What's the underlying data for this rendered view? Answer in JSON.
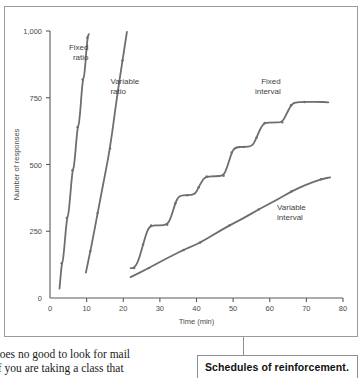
{
  "figure": {
    "caption": "Schedules of reinforcement."
  },
  "body_text": {
    "line1": "does no good to look for mail",
    "line2": "If you are taking a class that"
  },
  "chart_data": {
    "type": "line",
    "title": "",
    "xlabel": "Time (min)",
    "ylabel": "Number of responses",
    "xlim": [
      0,
      80
    ],
    "ylim": [
      0,
      1000
    ],
    "xticks": [
      0,
      10,
      20,
      30,
      40,
      50,
      60,
      70,
      80
    ],
    "xtick_labels": [
      "0",
      "10",
      "20",
      "30",
      "40",
      "50",
      "60",
      "70",
      "80"
    ],
    "yticks": [
      0,
      250,
      500,
      750,
      1000
    ],
    "ytick_labels": [
      "0",
      "250",
      "500",
      "750",
      "1,000"
    ],
    "grid": false,
    "legend": "inline-annotations",
    "line_color": "#6e6e6e",
    "series": [
      {
        "name": "Fixed ratio",
        "label_anchor": "end",
        "label_x": 10.5,
        "label_y": 930,
        "points": [
          [
            2.6,
            35
          ],
          [
            3.2,
            130
          ],
          [
            3.6,
            140
          ],
          [
            4.6,
            300
          ],
          [
            5.1,
            312
          ],
          [
            6.1,
            478
          ],
          [
            6.6,
            490
          ],
          [
            7.5,
            640
          ],
          [
            8.0,
            652
          ],
          [
            8.9,
            818
          ],
          [
            9.4,
            830
          ],
          [
            10.2,
            975
          ],
          [
            10.6,
            988
          ]
        ]
      },
      {
        "name": "Variable ratio",
        "label_anchor": "start",
        "label_x": 16.5,
        "label_y": 800,
        "points": [
          [
            9.8,
            95
          ],
          [
            11.0,
            175
          ],
          [
            11.6,
            215
          ],
          [
            13.0,
            318
          ],
          [
            14.4,
            418
          ],
          [
            16.4,
            560
          ],
          [
            18.2,
            745
          ],
          [
            19.8,
            890
          ],
          [
            21.0,
            997
          ]
        ]
      },
      {
        "name": "Fixed interval",
        "label_anchor": "end",
        "label_x": 63.0,
        "label_y": 800,
        "points": [
          [
            22.0,
            112
          ],
          [
            23.0,
            112
          ],
          [
            24.2,
            140
          ],
          [
            25.4,
            200
          ],
          [
            26.6,
            255
          ],
          [
            27.6,
            272
          ],
          [
            30.0,
            272
          ],
          [
            32.0,
            274
          ],
          [
            33.0,
            300
          ],
          [
            34.2,
            355
          ],
          [
            35.2,
            383
          ],
          [
            37.5,
            385
          ],
          [
            39.6,
            388
          ],
          [
            40.6,
            415
          ],
          [
            41.8,
            445
          ],
          [
            42.8,
            455
          ],
          [
            45.2,
            456
          ],
          [
            47.4,
            458
          ],
          [
            48.4,
            490
          ],
          [
            49.6,
            545
          ],
          [
            50.6,
            565
          ],
          [
            53.0,
            566
          ],
          [
            55.2,
            568
          ],
          [
            56.4,
            600
          ],
          [
            57.6,
            640
          ],
          [
            58.6,
            656
          ],
          [
            61.0,
            657
          ],
          [
            63.4,
            658
          ],
          [
            64.6,
            690
          ],
          [
            65.8,
            722
          ],
          [
            66.8,
            733
          ],
          [
            69.5,
            734
          ],
          [
            73.0,
            735
          ],
          [
            76.0,
            733
          ]
        ]
      },
      {
        "name": "Variable interval",
        "label_anchor": "start",
        "label_x": 62.0,
        "label_y": 330,
        "points": [
          [
            22.0,
            78
          ],
          [
            27.0,
            112
          ],
          [
            32.0,
            150
          ],
          [
            36.5,
            180
          ],
          [
            39.0,
            195
          ],
          [
            41.0,
            208
          ],
          [
            45.0,
            240
          ],
          [
            49.0,
            272
          ],
          [
            53.0,
            300
          ],
          [
            57.0,
            332
          ],
          [
            62.0,
            368
          ],
          [
            66.0,
            400
          ],
          [
            70.0,
            425
          ],
          [
            74.0,
            445
          ],
          [
            76.5,
            452
          ]
        ]
      }
    ]
  }
}
